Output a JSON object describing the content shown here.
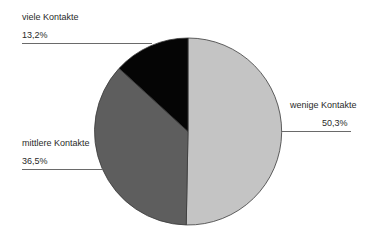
{
  "chart_data": {
    "type": "pie",
    "title": "",
    "slices": [
      {
        "label": "wenige Kontakte",
        "value": 50.3,
        "display": "50,3%",
        "color": "#c4c4c4"
      },
      {
        "label": "mittlere Kontakte",
        "value": 36.5,
        "display": "36,5%",
        "color": "#5e5e5e"
      },
      {
        "label": "viele Kontakte",
        "value": 13.2,
        "display": "13,2%",
        "color": "#050505"
      }
    ],
    "start_angle_deg": 0,
    "direction": "clockwise-from-top",
    "legend": "none",
    "labels": "external-with-leader-lines"
  },
  "labels": {
    "viele": {
      "name": "viele Kontakte",
      "pct": "13,2%"
    },
    "mittlere": {
      "name": "mittlere Kontakte",
      "pct": "36,5%"
    },
    "wenige": {
      "name": "wenige Kontakte",
      "pct": "50,3%"
    }
  }
}
